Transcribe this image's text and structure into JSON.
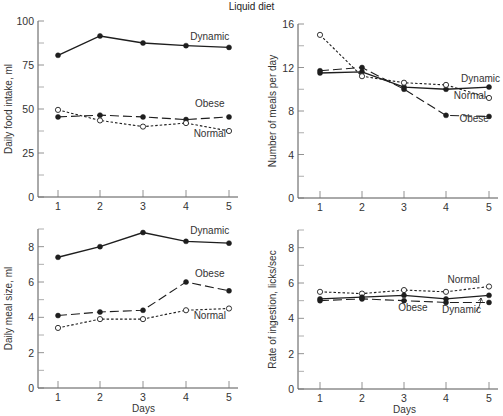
{
  "figure": {
    "title": "Liquid diet"
  },
  "chart_data": [
    {
      "id": "food_intake",
      "type": "line",
      "title": "",
      "xlabel": "",
      "ylabel": "Daily food intake, ml",
      "x": [
        1,
        2,
        3,
        4,
        5
      ],
      "xticks": [
        "1",
        "2",
        "3",
        "4",
        "5"
      ],
      "ylim": [
        0,
        100
      ],
      "yticks": [
        0,
        25,
        50,
        75,
        100
      ],
      "minor_yticks": [
        12.5,
        37.5,
        62.5,
        87.5
      ],
      "grid": false,
      "series": [
        {
          "name": "Dynamic",
          "style": "solid",
          "marker": "filled",
          "values": [
            80.5,
            91.5,
            87.5,
            86,
            85
          ]
        },
        {
          "name": "Obese",
          "style": "long-dash",
          "marker": "filled",
          "values": [
            45.5,
            46.5,
            45.5,
            44,
            45.5
          ]
        },
        {
          "name": "Normal",
          "style": "dotted",
          "marker": "open",
          "values": [
            49.5,
            43.5,
            40,
            42,
            37.5
          ]
        }
      ],
      "annotations": [
        {
          "text": "Dynamic",
          "x": 4.55,
          "y": 89
        },
        {
          "text": "Obese",
          "x": 4.55,
          "y": 51
        },
        {
          "text": "Normal",
          "x": 4.55,
          "y": 34
        }
      ]
    },
    {
      "id": "meals_per_day",
      "type": "line",
      "title": "",
      "xlabel": "",
      "ylabel": "Number of meals per day",
      "x": [
        1,
        2,
        3,
        4,
        5
      ],
      "xticks": [
        "1",
        "2",
        "3",
        "4",
        "5"
      ],
      "ylim": [
        0,
        16
      ],
      "yticks": [
        0,
        4,
        8,
        12,
        16
      ],
      "minor_yticks": [
        2,
        6,
        10,
        14
      ],
      "grid": false,
      "series": [
        {
          "name": "Dynamic",
          "style": "solid",
          "marker": "filled",
          "values": [
            11.5,
            11.6,
            10.2,
            10.0,
            10.2
          ]
        },
        {
          "name": "Normal",
          "style": "dotted",
          "marker": "open",
          "values": [
            15.0,
            11.2,
            10.6,
            10.4,
            9.2
          ]
        },
        {
          "name": "Obese",
          "style": "long-dash",
          "marker": "filled",
          "values": [
            11.7,
            12.0,
            10.0,
            7.6,
            7.5
          ]
        }
      ],
      "annotations": [
        {
          "text": "Dynamic",
          "x": 4.8,
          "y": 10.7
        },
        {
          "text": "Normal",
          "x": 4.55,
          "y": 9.1
        },
        {
          "text": "Obese",
          "x": 4.65,
          "y": 7.0
        }
      ]
    },
    {
      "id": "meal_size",
      "type": "line",
      "title": "",
      "xlabel": "Days",
      "ylabel": "Daily meal size, ml",
      "x": [
        1,
        2,
        3,
        4,
        5
      ],
      "xticks": [
        "1",
        "2",
        "3",
        "4",
        "5"
      ],
      "ylim": [
        0,
        9
      ],
      "yticks": [
        0,
        2,
        4,
        6,
        8
      ],
      "minor_yticks": [
        1,
        3,
        5,
        7
      ],
      "grid": false,
      "series": [
        {
          "name": "Dynamic",
          "style": "solid",
          "marker": "filled",
          "values": [
            7.4,
            8.0,
            8.8,
            8.3,
            8.2
          ]
        },
        {
          "name": "Obese",
          "style": "long-dash",
          "marker": "filled",
          "values": [
            4.1,
            4.3,
            4.4,
            6.0,
            5.5
          ]
        },
        {
          "name": "Normal",
          "style": "dotted",
          "marker": "open",
          "values": [
            3.4,
            3.9,
            3.9,
            4.4,
            4.5
          ]
        }
      ],
      "annotations": [
        {
          "text": "Dynamic",
          "x": 4.55,
          "y": 8.7
        },
        {
          "text": "Obese",
          "x": 4.55,
          "y": 6.3
        },
        {
          "text": "Normal",
          "x": 4.55,
          "y": 3.9
        }
      ]
    },
    {
      "id": "ingestion_rate",
      "type": "line",
      "title": "",
      "xlabel": "Days",
      "ylabel": "Rate of ingestion, licks/sec",
      "x": [
        1,
        2,
        3,
        4,
        5
      ],
      "xticks": [
        "1",
        "2",
        "3",
        "4",
        "5"
      ],
      "ylim": [
        0,
        9
      ],
      "yticks": [
        0,
        2,
        4,
        6,
        8
      ],
      "minor_yticks": [
        1,
        3,
        5,
        7
      ],
      "grid": false,
      "series": [
        {
          "name": "Normal",
          "style": "dotted",
          "marker": "open",
          "values": [
            5.5,
            5.4,
            5.6,
            5.5,
            5.8
          ]
        },
        {
          "name": "Dynamic",
          "style": "solid",
          "marker": "filled",
          "values": [
            5.1,
            5.2,
            5.3,
            5.1,
            5.3
          ]
        },
        {
          "name": "Obese",
          "style": "long-dash",
          "marker": "filled",
          "values": [
            5.0,
            5.1,
            5.0,
            4.9,
            4.9
          ]
        }
      ],
      "annotations": [
        {
          "text": "Normal",
          "x": 4.4,
          "y": 6.0
        },
        {
          "text": "Obese",
          "x": 3.2,
          "y": 4.4
        },
        {
          "text": "Dynamic",
          "x": 4.35,
          "y": 4.3
        }
      ]
    }
  ],
  "layout": {
    "panels": [
      {
        "x0": 38,
        "y0": 21,
        "x1": 238,
        "y1": 197,
        "xpos": [
          58,
          100,
          143,
          186,
          229
        ],
        "ylabel_x": 12
      },
      {
        "x0": 298,
        "y0": 24,
        "x1": 498,
        "y1": 198,
        "xpos": [
          320,
          362,
          404,
          446,
          489
        ],
        "ylabel_x": 276
      },
      {
        "x0": 38,
        "y0": 229,
        "x1": 238,
        "y1": 388,
        "xpos": [
          58,
          100,
          143,
          186,
          229
        ],
        "ylabel_x": 12
      },
      {
        "x0": 298,
        "y0": 230,
        "x1": 498,
        "y1": 389,
        "xpos": [
          320,
          362,
          404,
          446,
          489
        ],
        "ylabel_x": 276
      }
    ],
    "line_color": "#1e1e1e",
    "text_color": "#333333"
  }
}
